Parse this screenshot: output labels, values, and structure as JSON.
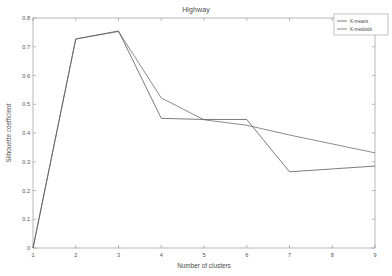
{
  "chart_data": {
    "type": "line",
    "title": "Highway",
    "xlabel": "Number of clusters",
    "ylabel": "Silhouette coefficient",
    "x": [
      1,
      2,
      3,
      4,
      5,
      6,
      7,
      8,
      9
    ],
    "xlim": [
      1,
      9
    ],
    "ylim": [
      0,
      0.8
    ],
    "xticks": [
      "1",
      "2",
      "3",
      "4",
      "5",
      "6",
      "7",
      "8",
      "9"
    ],
    "yticks": [
      "0",
      "0.1",
      "0.2",
      "0.3",
      "0.4",
      "0.5",
      "0.6",
      "0.7",
      "0.8"
    ],
    "grid": false,
    "legend_position": "top-right",
    "series": [
      {
        "name": "K-means",
        "color": "#5b5b5b",
        "values": [
          0.0,
          0.727,
          0.755,
          0.451,
          0.447,
          0.447,
          0.265,
          0.275,
          0.285
        ]
      },
      {
        "name": "K-medoids",
        "color": "#6e6e6e",
        "values": [
          0.0,
          0.727,
          0.753,
          0.522,
          0.446,
          0.427,
          0.393,
          0.362,
          0.331
        ]
      }
    ]
  },
  "legend": {
    "items": [
      {
        "label": "K-means"
      },
      {
        "label": "K-medoids"
      }
    ]
  },
  "axes": {
    "x_title": "Number of clusters",
    "y_title": "Silhouette coefficient",
    "x_tick_labels": [
      "1",
      "2",
      "3",
      "4",
      "5",
      "6",
      "7",
      "8",
      "9"
    ],
    "y_tick_labels": [
      "0",
      "0.1",
      "0.2",
      "0.3",
      "0.4",
      "0.5",
      "0.6",
      "0.7",
      "0.8"
    ]
  },
  "colors": {
    "axis": "#9a9a9a",
    "text": "#4a4a4a",
    "kmeans": "#5b5b5b",
    "kmedoids": "#6e6e6e",
    "background": "#ffffff"
  }
}
